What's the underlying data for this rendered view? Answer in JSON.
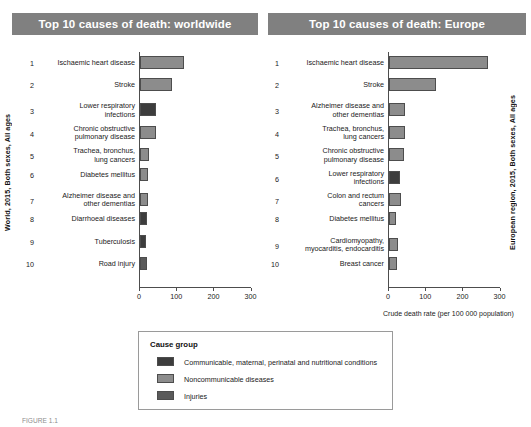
{
  "charts": [
    {
      "title": "Top 10 causes of death: worldwide",
      "y_axis_label": "World, 2015, Both sexes, All ages",
      "x_axis_label": "",
      "x_ticks": [
        "0",
        "100",
        "200",
        "300"
      ]
    },
    {
      "title": "Top 10 causes of death: Europe",
      "y_axis_label": "European region, 2015, Both sexes, All ages",
      "x_axis_label": "Crude death rate (per 100 000 population)",
      "x_ticks": [
        "0",
        "100",
        "200",
        "300"
      ]
    }
  ],
  "legend": {
    "title": "Cause group",
    "items": [
      {
        "label": "Communicable, maternal, perinatal and nutritional conditions",
        "color": "#3d3d3d"
      },
      {
        "label": "Noncommunicable diseases",
        "color": "#8c8c8c"
      },
      {
        "label": "Injuries",
        "color": "#5a5a5a"
      }
    ]
  },
  "caption": "FIGURE 1.1",
  "chart_data": [
    {
      "type": "bar",
      "title": "Top 10 causes of death: worldwide",
      "xlabel": "Crude death rate (per 100 000 population)",
      "ylabel": "World, 2015, Both sexes, All ages",
      "xlim": [
        0,
        330
      ],
      "orientation": "horizontal",
      "grid": false,
      "legend_position": "bottom",
      "ranks": [
        1,
        2,
        3,
        4,
        5,
        6,
        7,
        8,
        9,
        10
      ],
      "categories": [
        "Ischaemic heart disease",
        "Stroke",
        "Lower respiratory\ninfections",
        "Chronic obstructive\npulmonary disease",
        "Trachea, bronchus,\nlung cancers",
        "Diabetes mellitus",
        "Alzheimer disease and\nother dementias",
        "Diarrhoeal diseases",
        "Tuberculosis",
        "Road injury"
      ],
      "values": [
        119,
        85,
        42,
        42,
        23,
        21,
        21,
        19,
        17,
        18
      ],
      "groups": [
        "Noncommunicable diseases",
        "Noncommunicable diseases",
        "Communicable, maternal, perinatal and nutritional conditions",
        "Noncommunicable diseases",
        "Noncommunicable diseases",
        "Noncommunicable diseases",
        "Noncommunicable diseases",
        "Communicable, maternal, perinatal and nutritional conditions",
        "Communicable, maternal, perinatal and nutritional conditions",
        "Injuries"
      ],
      "colors": [
        "#8c8c8c",
        "#8c8c8c",
        "#3d3d3d",
        "#8c8c8c",
        "#8c8c8c",
        "#8c8c8c",
        "#8c8c8c",
        "#3d3d3d",
        "#3d3d3d",
        "#5a5a5a"
      ]
    },
    {
      "type": "bar",
      "title": "Top 10 causes of death: Europe",
      "xlabel": "Crude death rate (per 100 000 population)",
      "ylabel": "European region, 2015, Both sexes, All ages",
      "xlim": [
        0,
        330
      ],
      "orientation": "horizontal",
      "grid": false,
      "legend_position": "bottom",
      "ranks": [
        1,
        2,
        3,
        4,
        5,
        6,
        7,
        8,
        9,
        10
      ],
      "categories": [
        "Ischaemic heart disease",
        "Stroke",
        "Alzheimer disease and\nother dementias",
        "Trachea, bronchus,\nlung cancers",
        "Chronic obstructive\npulmonary disease",
        "Lower respiratory\ninfections",
        "Colon and rectum\ncancers",
        "Diabetes mellitus",
        "Cardiomyopathy,\nmyocarditis, endocarditis",
        "Breast cancer"
      ],
      "values": [
        265,
        125,
        42,
        43,
        40,
        29,
        31,
        20,
        23,
        22
      ],
      "groups": [
        "Noncommunicable diseases",
        "Noncommunicable diseases",
        "Noncommunicable diseases",
        "Noncommunicable diseases",
        "Noncommunicable diseases",
        "Communicable, maternal, perinatal and nutritional conditions",
        "Noncommunicable diseases",
        "Noncommunicable diseases",
        "Noncommunicable diseases",
        "Noncommunicable diseases"
      ],
      "colors": [
        "#8c8c8c",
        "#8c8c8c",
        "#8c8c8c",
        "#8c8c8c",
        "#8c8c8c",
        "#3d3d3d",
        "#8c8c8c",
        "#8c8c8c",
        "#8c8c8c",
        "#8c8c8c"
      ]
    }
  ]
}
